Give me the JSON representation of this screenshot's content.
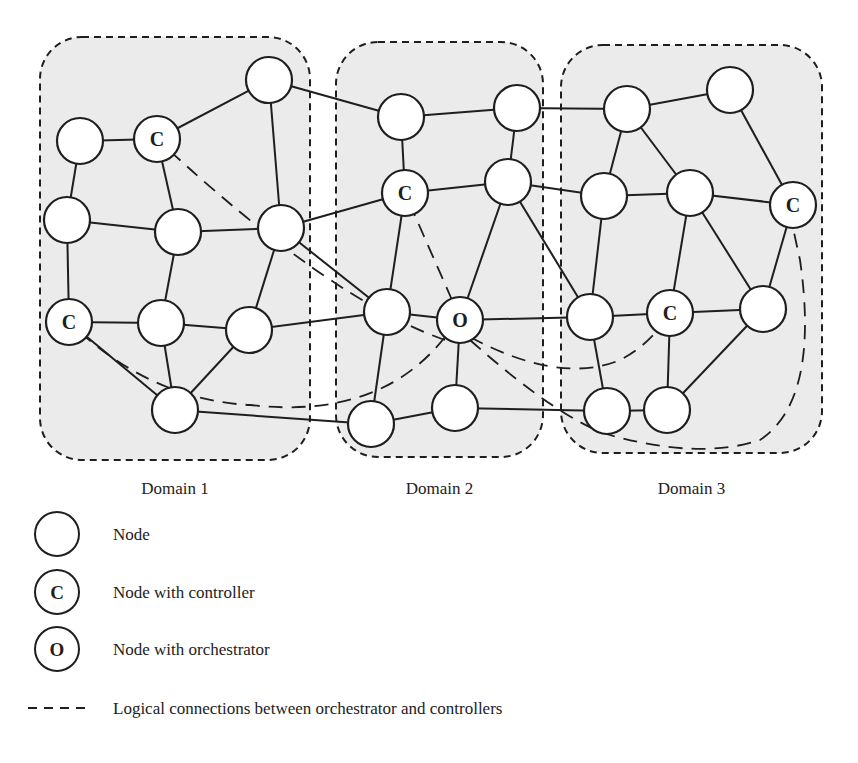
{
  "domains": [
    {
      "id": "d1",
      "label": "Domain 1",
      "box": {
        "x": 40,
        "y": 37,
        "w": 270,
        "h": 423
      }
    },
    {
      "id": "d2",
      "label": "Domain 2",
      "box": {
        "x": 336,
        "y": 42,
        "w": 207,
        "h": 415
      }
    },
    {
      "id": "d3",
      "label": "Domain 3",
      "box": {
        "x": 561,
        "y": 45,
        "w": 261,
        "h": 408
      }
    }
  ],
  "domain_labels_y": 494,
  "nodes": [
    {
      "id": "a1",
      "x": 80,
      "y": 141,
      "type": "node"
    },
    {
      "id": "a2",
      "x": 157,
      "y": 139,
      "type": "controller"
    },
    {
      "id": "a3",
      "x": 269,
      "y": 80,
      "type": "node"
    },
    {
      "id": "a4",
      "x": 67,
      "y": 220,
      "type": "node"
    },
    {
      "id": "a5",
      "x": 178,
      "y": 232,
      "type": "node"
    },
    {
      "id": "a6",
      "x": 281,
      "y": 228,
      "type": "node"
    },
    {
      "id": "a7",
      "x": 69,
      "y": 322,
      "type": "controller"
    },
    {
      "id": "a8",
      "x": 161,
      "y": 323,
      "type": "node"
    },
    {
      "id": "a9",
      "x": 249,
      "y": 330,
      "type": "node"
    },
    {
      "id": "a10",
      "x": 175,
      "y": 410,
      "type": "node"
    },
    {
      "id": "b1",
      "x": 401,
      "y": 117,
      "type": "node"
    },
    {
      "id": "b2",
      "x": 517,
      "y": 108,
      "type": "node"
    },
    {
      "id": "b3",
      "x": 405,
      "y": 193,
      "type": "controller"
    },
    {
      "id": "b4",
      "x": 508,
      "y": 182,
      "type": "node"
    },
    {
      "id": "b5",
      "x": 387,
      "y": 312,
      "type": "node"
    },
    {
      "id": "b6",
      "x": 460,
      "y": 320,
      "type": "orchestrator"
    },
    {
      "id": "b7",
      "x": 371,
      "y": 424,
      "type": "node"
    },
    {
      "id": "b8",
      "x": 455,
      "y": 408,
      "type": "node"
    },
    {
      "id": "c1",
      "x": 627,
      "y": 109,
      "type": "node"
    },
    {
      "id": "c2",
      "x": 730,
      "y": 90,
      "type": "node"
    },
    {
      "id": "c3",
      "x": 604,
      "y": 196,
      "type": "node"
    },
    {
      "id": "c4",
      "x": 690,
      "y": 193,
      "type": "node"
    },
    {
      "id": "c5",
      "x": 793,
      "y": 205,
      "type": "controller"
    },
    {
      "id": "c6",
      "x": 590,
      "y": 317,
      "type": "node"
    },
    {
      "id": "c7",
      "x": 670,
      "y": 313,
      "type": "controller"
    },
    {
      "id": "c8",
      "x": 763,
      "y": 309,
      "type": "node"
    },
    {
      "id": "c9",
      "x": 607,
      "y": 411,
      "type": "node"
    },
    {
      "id": "c10",
      "x": 667,
      "y": 410,
      "type": "node"
    }
  ],
  "node_radius": 23,
  "node_labels": {
    "controller": "C",
    "orchestrator": "O"
  },
  "edges": [
    [
      "a1",
      "a2"
    ],
    [
      "a1",
      "a4"
    ],
    [
      "a2",
      "a3"
    ],
    [
      "a2",
      "a5"
    ],
    [
      "a3",
      "a6"
    ],
    [
      "a3",
      "b1"
    ],
    [
      "a4",
      "a5"
    ],
    [
      "a4",
      "a7"
    ],
    [
      "a5",
      "a6"
    ],
    [
      "a5",
      "a8"
    ],
    [
      "a6",
      "a9"
    ],
    [
      "a6",
      "b3"
    ],
    [
      "a6",
      "b5"
    ],
    [
      "a7",
      "a8"
    ],
    [
      "a7",
      "a10"
    ],
    [
      "a8",
      "a9"
    ],
    [
      "a8",
      "a10"
    ],
    [
      "a9",
      "a10"
    ],
    [
      "a9",
      "b5"
    ],
    [
      "a10",
      "b7"
    ],
    [
      "b1",
      "b2"
    ],
    [
      "b1",
      "b3"
    ],
    [
      "b2",
      "b4"
    ],
    [
      "b2",
      "c1"
    ],
    [
      "b3",
      "b4"
    ],
    [
      "b3",
      "b5"
    ],
    [
      "b4",
      "b6"
    ],
    [
      "b4",
      "c3"
    ],
    [
      "b4",
      "c6"
    ],
    [
      "b5",
      "b6"
    ],
    [
      "b5",
      "b7"
    ],
    [
      "b6",
      "b8"
    ],
    [
      "b6",
      "c6"
    ],
    [
      "b7",
      "b8"
    ],
    [
      "b8",
      "c9"
    ],
    [
      "c1",
      "c2"
    ],
    [
      "c1",
      "c3"
    ],
    [
      "c1",
      "c4"
    ],
    [
      "c2",
      "c5"
    ],
    [
      "c3",
      "c4"
    ],
    [
      "c3",
      "c6"
    ],
    [
      "c4",
      "c5"
    ],
    [
      "c4",
      "c7"
    ],
    [
      "c4",
      "c8"
    ],
    [
      "c5",
      "c8"
    ],
    [
      "c6",
      "c7"
    ],
    [
      "c6",
      "c9"
    ],
    [
      "c7",
      "c8"
    ],
    [
      "c7",
      "c10"
    ],
    [
      "c9",
      "c10"
    ],
    [
      "c8",
      "c10"
    ]
  ],
  "logical_connections": [
    {
      "from": "b6",
      "to": "a2",
      "path": "M445,340 Q330,300 157,139"
    },
    {
      "from": "b6",
      "to": "a7",
      "path": "M445,337 Q380,420 250,405 Q150,400 69,322"
    },
    {
      "from": "b6",
      "to": "b3",
      "path": "M452,300 L405,193"
    },
    {
      "from": "b6",
      "to": "c7",
      "path": "M470,337 Q560,385 620,360 Q650,345 670,313"
    },
    {
      "from": "b6",
      "to": "c5",
      "path": "M470,340 Q560,420 610,435 Q700,460 760,440 Q820,400 800,260 L793,228"
    }
  ],
  "legend": {
    "items": [
      {
        "symbol": "node",
        "label": "Node",
        "y": 534
      },
      {
        "symbol": "controller",
        "label": "Node with controller",
        "y": 592
      },
      {
        "symbol": "orchestrator",
        "label": "Node with orchestrator",
        "y": 649
      },
      {
        "symbol": "dashed-line",
        "label": "Logical connections between orchestrator and controllers",
        "y": 708
      }
    ]
  },
  "colors": {
    "domain_fill": "#ebebeb",
    "stroke": "#1e1e1e",
    "node_fill": "#ffffff"
  }
}
